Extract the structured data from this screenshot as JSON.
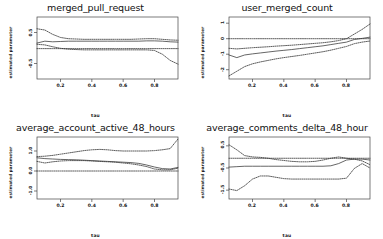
{
  "figure": {
    "layout": "2x2",
    "background": "#ffffff",
    "axis_color": "#444444",
    "line_color": "#333333"
  },
  "chart_data": [
    {
      "type": "line",
      "title": "merged_pull_request",
      "xlabel": "tau",
      "ylabel": "estimated parameter",
      "xlim": [
        0.05,
        0.95
      ],
      "ylim": [
        -1.0,
        1.0
      ],
      "xticks": [
        0.2,
        0.4,
        0.6,
        0.8
      ],
      "xticklabels": [
        "0.2",
        "0.4",
        "0.6",
        "0.8"
      ],
      "yticks": [
        -0.5,
        0.5
      ],
      "yticklabels": [
        "-0.5",
        "0.5"
      ],
      "grid": false,
      "legend": "none",
      "x": [
        0.05,
        0.1,
        0.15,
        0.2,
        0.25,
        0.3,
        0.35,
        0.4,
        0.45,
        0.5,
        0.55,
        0.6,
        0.65,
        0.7,
        0.75,
        0.8,
        0.85,
        0.9,
        0.95
      ],
      "series": [
        {
          "name": "estimate",
          "style": "solid",
          "values": [
            0.16,
            0.22,
            0.2,
            0.21,
            0.22,
            0.22,
            0.22,
            0.22,
            0.22,
            0.22,
            0.22,
            0.22,
            0.22,
            0.22,
            0.23,
            0.23,
            0.22,
            0.2,
            0.19
          ]
        },
        {
          "name": "upper_ci",
          "style": "dotted",
          "values": [
            0.62,
            0.58,
            0.44,
            0.34,
            0.3,
            0.29,
            0.28,
            0.28,
            0.28,
            0.28,
            0.28,
            0.28,
            0.28,
            0.29,
            0.3,
            0.3,
            0.28,
            0.26,
            0.25
          ]
        },
        {
          "name": "lower_ci",
          "style": "dotted",
          "values": [
            0.12,
            0.1,
            0.04,
            -0.01,
            -0.04,
            -0.05,
            -0.06,
            -0.06,
            -0.06,
            -0.06,
            -0.06,
            -0.06,
            -0.06,
            -0.06,
            -0.06,
            -0.08,
            -0.2,
            -0.4,
            -0.52
          ]
        },
        {
          "name": "zero_line",
          "style": "dotted",
          "values": [
            -0.02,
            -0.02,
            -0.02,
            -0.02,
            -0.02,
            -0.02,
            -0.02,
            -0.02,
            -0.02,
            -0.02,
            -0.02,
            -0.02,
            -0.02,
            -0.02,
            -0.02,
            -0.02,
            -0.02,
            -0.02,
            -0.02
          ]
        }
      ]
    },
    {
      "type": "line",
      "title": "user_merged_count",
      "xlabel": "tau",
      "ylabel": "estimated parameter",
      "xlim": [
        0.05,
        0.95
      ],
      "ylim": [
        -2.6,
        1.4
      ],
      "xticks": [
        0.2,
        0.4,
        0.6,
        0.8
      ],
      "xticklabels": [
        "0.2",
        "0.4",
        "0.6",
        "0.8"
      ],
      "yticks": [
        -2,
        -1,
        0,
        1
      ],
      "yticklabels": [
        "-2",
        "-1",
        "0",
        "1"
      ],
      "grid": false,
      "legend": "none",
      "x": [
        0.05,
        0.1,
        0.15,
        0.2,
        0.25,
        0.3,
        0.35,
        0.4,
        0.45,
        0.5,
        0.55,
        0.6,
        0.65,
        0.7,
        0.75,
        0.8,
        0.85,
        0.9,
        0.95
      ],
      "series": [
        {
          "name": "estimate",
          "style": "solid",
          "values": [
            -1.05,
            -1.22,
            -1.05,
            -0.98,
            -0.92,
            -0.86,
            -0.8,
            -0.75,
            -0.7,
            -0.64,
            -0.58,
            -0.52,
            -0.46,
            -0.38,
            -0.3,
            -0.22,
            -0.05,
            0.02,
            0.1
          ]
        },
        {
          "name": "upper_ci",
          "style": "dotted",
          "values": [
            -0.62,
            -0.66,
            -0.62,
            -0.58,
            -0.55,
            -0.52,
            -0.48,
            -0.45,
            -0.42,
            -0.38,
            -0.34,
            -0.3,
            -0.26,
            -0.2,
            -0.12,
            0.0,
            0.3,
            0.6,
            0.95
          ]
        },
        {
          "name": "lower_ci",
          "style": "dotted",
          "values": [
            -2.4,
            -2.1,
            -1.8,
            -1.62,
            -1.5,
            -1.4,
            -1.3,
            -1.22,
            -1.15,
            -1.08,
            -1.0,
            -0.92,
            -0.84,
            -0.74,
            -0.62,
            -0.5,
            -0.32,
            -0.22,
            -0.15
          ]
        },
        {
          "name": "zero_line",
          "style": "dotted",
          "values": [
            0.0,
            0.0,
            0.0,
            0.0,
            0.0,
            0.0,
            0.0,
            0.0,
            0.0,
            0.0,
            0.0,
            0.0,
            0.0,
            0.0,
            0.0,
            0.0,
            0.0,
            0.0,
            0.0
          ]
        }
      ]
    },
    {
      "type": "line",
      "title": "average_account_active_48_hours",
      "xlabel": "tau",
      "ylabel": "estimated parameter",
      "xlim": [
        0.05,
        0.95
      ],
      "ylim": [
        -1.4,
        1.7
      ],
      "xticks": [
        0.2,
        0.4,
        0.6,
        0.8
      ],
      "xticklabels": [
        "0.2",
        "0.4",
        "0.6",
        "0.8"
      ],
      "yticks": [
        -1.0,
        0.0,
        1.0
      ],
      "yticklabels": [
        "-1.0",
        "0.0",
        "1.0"
      ],
      "grid": false,
      "legend": "none",
      "x": [
        0.05,
        0.1,
        0.15,
        0.2,
        0.25,
        0.3,
        0.35,
        0.4,
        0.45,
        0.5,
        0.55,
        0.6,
        0.65,
        0.7,
        0.75,
        0.8,
        0.85,
        0.9,
        0.95
      ],
      "series": [
        {
          "name": "estimate",
          "style": "solid",
          "values": [
            0.66,
            0.62,
            0.6,
            0.58,
            0.57,
            0.56,
            0.54,
            0.52,
            0.5,
            0.48,
            0.46,
            0.44,
            0.42,
            0.38,
            0.3,
            0.2,
            0.12,
            0.1,
            0.18
          ]
        },
        {
          "name": "upper_ci",
          "style": "dotted",
          "values": [
            0.72,
            0.74,
            0.78,
            0.84,
            0.9,
            0.96,
            1.02,
            1.06,
            1.08,
            1.06,
            1.02,
            1.0,
            1.0,
            1.0,
            1.0,
            1.02,
            1.06,
            1.12,
            1.6
          ]
        },
        {
          "name": "lower_ci",
          "style": "dotted",
          "values": [
            0.48,
            0.4,
            0.46,
            0.5,
            0.52,
            0.52,
            0.52,
            0.5,
            0.48,
            0.46,
            0.44,
            0.4,
            0.36,
            0.3,
            0.22,
            0.1,
            0.06,
            0.06,
            0.14
          ]
        },
        {
          "name": "zero_line",
          "style": "dotted",
          "values": [
            0.0,
            0.0,
            0.0,
            0.0,
            0.0,
            0.0,
            0.0,
            0.0,
            0.0,
            0.0,
            0.0,
            0.0,
            0.0,
            0.0,
            0.0,
            0.0,
            0.0,
            0.0,
            0.0
          ]
        }
      ]
    },
    {
      "type": "line",
      "title": "average_comments_delta_48_hour",
      "xlabel": "tau",
      "ylabel": "estimated parameter",
      "xlim": [
        0.05,
        0.95
      ],
      "ylim": [
        -1.9,
        0.9
      ],
      "xticks": [
        0.2,
        0.4,
        0.6,
        0.8
      ],
      "xticklabels": [
        "0.2",
        "0.4",
        "0.6",
        "0.8"
      ],
      "yticks": [
        -1.5,
        -0.5,
        0.5
      ],
      "yticklabels": [
        "-1.5",
        "-0.5",
        "0.5"
      ],
      "grid": false,
      "legend": "none",
      "x": [
        0.05,
        0.1,
        0.15,
        0.2,
        0.25,
        0.3,
        0.35,
        0.4,
        0.45,
        0.5,
        0.55,
        0.6,
        0.65,
        0.7,
        0.75,
        0.8,
        0.85,
        0.9,
        0.95
      ],
      "series": [
        {
          "name": "estimate",
          "style": "solid",
          "values": [
            -0.46,
            -0.44,
            -0.42,
            -0.42,
            -0.42,
            -0.42,
            -0.42,
            -0.42,
            -0.42,
            -0.42,
            -0.42,
            -0.42,
            -0.42,
            -0.4,
            -0.3,
            -0.14,
            -0.1,
            -0.1,
            -0.14
          ]
        },
        {
          "name": "upper_ci",
          "style": "dotted",
          "values": [
            0.55,
            0.32,
            0.06,
            0.0,
            -0.02,
            -0.06,
            -0.12,
            -0.16,
            -0.2,
            -0.22,
            -0.22,
            -0.2,
            -0.14,
            -0.06,
            0.0,
            -0.06,
            -0.1,
            -0.18,
            -0.35
          ]
        },
        {
          "name": "lower_ci",
          "style": "dotted",
          "values": [
            -1.45,
            -1.52,
            -1.3,
            -1.0,
            -0.86,
            -0.86,
            -0.92,
            -0.98,
            -1.0,
            -1.0,
            -1.0,
            -1.0,
            -1.0,
            -1.0,
            -1.0,
            -0.96,
            -0.52,
            -0.3,
            -0.5
          ]
        },
        {
          "name": "zero_line",
          "style": "dotted",
          "values": [
            -0.06,
            -0.06,
            -0.06,
            -0.06,
            -0.06,
            -0.06,
            -0.06,
            -0.06,
            -0.06,
            -0.06,
            -0.06,
            -0.06,
            -0.06,
            -0.06,
            -0.06,
            -0.06,
            -0.06,
            -0.06,
            -0.06
          ]
        }
      ]
    }
  ]
}
